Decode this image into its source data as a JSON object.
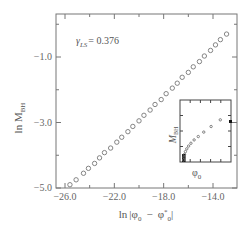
{
  "chart_data": [
    {
      "type": "scatter",
      "title": "",
      "xlabel": "ln|φ0 − φ*0|",
      "ylabel": "ln M_BH",
      "xlim": [
        -26.8,
        -12.3
      ],
      "ylim": [
        -5.0,
        0.2
      ],
      "x_ticks": [
        -26.0,
        -22.0,
        -18.0,
        -14.0
      ],
      "x_tick_labels": [
        "−26.0",
        "−22.0",
        "−18.0",
        "−14.0"
      ],
      "y_ticks": [
        -1.0,
        -3.0,
        -5.0
      ],
      "y_tick_labels": [
        "−1.0",
        "−3.0",
        "−5.0"
      ],
      "grid": false,
      "marker": "open-circle",
      "annotation": {
        "label": "γ_LS",
        "value": "= 0.376"
      },
      "series": [
        {
          "name": "ln M_BH vs ln|φ0 − φ*0|",
          "x": [
            -25.6,
            -25.1,
            -24.5,
            -24.1,
            -23.6,
            -23.2,
            -22.8,
            -22.3,
            -21.8,
            -21.4,
            -20.9,
            -20.5,
            -20.0,
            -19.6,
            -19.1,
            -18.7,
            -18.2,
            -17.8,
            -17.3,
            -16.9,
            -16.5,
            -16.0,
            -15.6,
            -15.1,
            -14.7,
            -14.2,
            -13.8,
            -13.4,
            -12.9
          ],
          "y": [
            -4.9,
            -4.75,
            -4.55,
            -4.4,
            -4.25,
            -4.08,
            -3.92,
            -3.78,
            -3.6,
            -3.45,
            -3.28,
            -3.12,
            -2.95,
            -2.78,
            -2.62,
            -2.45,
            -2.3,
            -2.12,
            -1.95,
            -1.8,
            -1.62,
            -1.47,
            -1.3,
            -1.14,
            -0.97,
            -0.8,
            -0.63,
            -0.47,
            -0.3
          ]
        }
      ],
      "slope": 0.376
    },
    {
      "type": "scatter",
      "role": "inset",
      "xlabel": "φ0",
      "ylabel": "M_BH",
      "marker": "open-circle",
      "series": [
        {
          "name": "M_BH vs φ0",
          "description": "Mass rises from zero at critical φ0* with power-law onset; points densely clustered near threshold",
          "x_rel": [
            0.0,
            0.01,
            0.02,
            0.04,
            0.07,
            0.11,
            0.16,
            0.23,
            0.32,
            0.44,
            0.6,
            0.8
          ],
          "y_rel": [
            0.0,
            0.05,
            0.1,
            0.15,
            0.2,
            0.25,
            0.3,
            0.36,
            0.42,
            0.5,
            0.6,
            0.72
          ]
        }
      ]
    }
  ],
  "labels": {
    "gamma_symbol": "γ",
    "gamma_sub": "LS",
    "gamma_value": "= 0.376",
    "y_axis_main": "ln M",
    "y_axis_sub": "BH",
    "x_axis_ln": "ln",
    "x_axis_phi": "φ",
    "x_axis_minus": "−",
    "x_axis_phi_star": "φ",
    "inset_y": "M",
    "inset_y_sub": "BH",
    "inset_x": "φ"
  }
}
